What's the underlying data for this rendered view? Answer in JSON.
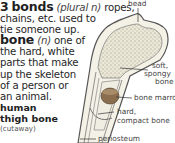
{
  "entries": [
    {
      "number": "3",
      "headword": "bonds",
      "part_of_speech": "(plural n)",
      "lines": [
        "ropes,",
        "chains, etc. used to",
        "tie someone up."
      ]
    },
    {
      "headword": "bone",
      "part_of_speech": "(n)",
      "lines": [
        "one of",
        "the hard, white",
        "parts that make",
        "up the skeleton",
        "of a person or",
        "an animal."
      ]
    }
  ],
  "illustration": {
    "caption_line1": "human",
    "caption_line2": "thigh bone",
    "caption_sub": "(cutaway)",
    "labels": {
      "head": "head",
      "soft1": "soft,",
      "soft2": "spongy",
      "soft3": "bone",
      "marrow": "bone marrow",
      "hard1": "hard,",
      "hard2": "compact bone",
      "periosteum": "periosteum"
    },
    "colors": {
      "bone_fill": "#f4f1e6",
      "spongy": "#e6e2d2",
      "marrow": "#8b6e4e",
      "outline": "#555555"
    }
  }
}
